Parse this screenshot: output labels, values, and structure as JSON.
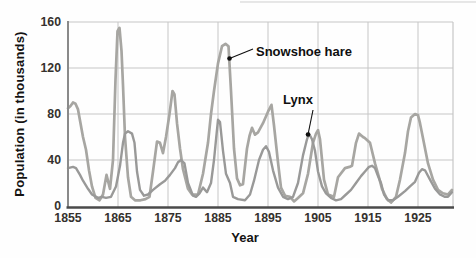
{
  "figure": {
    "x_axis_title": "Year",
    "y_axis_title": "Population (in thousands)"
  },
  "chart_data": {
    "type": "line",
    "title": "",
    "xlabel": "Year",
    "ylabel": "Population (in thousands)",
    "xlim": [
      1855,
      1932
    ],
    "ylim": [
      0,
      160
    ],
    "grid": true,
    "x_ticks": [
      1855,
      1865,
      1875,
      1885,
      1895,
      1905,
      1915,
      1925
    ],
    "y_ticks": [
      0,
      40,
      80,
      120,
      160
    ],
    "legend_position": "none (direct line labels with arrows)",
    "series": [
      {
        "name": "Snowshoe hare",
        "color": "#a7a6a2",
        "width": 2.7,
        "points": [
          [
            1855,
            85
          ],
          [
            1855.5,
            87
          ],
          [
            1856,
            90
          ],
          [
            1856.5,
            89
          ],
          [
            1857,
            84
          ],
          [
            1857.5,
            72
          ],
          [
            1858,
            60
          ],
          [
            1858.6,
            49
          ],
          [
            1859.2,
            31
          ],
          [
            1859.8,
            17
          ],
          [
            1860.5,
            7
          ],
          [
            1861.3,
            5
          ],
          [
            1862,
            10
          ],
          [
            1862.7,
            27
          ],
          [
            1863.4,
            15
          ],
          [
            1864,
            40
          ],
          [
            1864.5,
            110
          ],
          [
            1864.9,
            152
          ],
          [
            1865.3,
            155
          ],
          [
            1865.7,
            135
          ],
          [
            1866,
            105
          ],
          [
            1866.4,
            60
          ],
          [
            1867,
            25
          ],
          [
            1867.6,
            8
          ],
          [
            1868.4,
            5
          ],
          [
            1869.5,
            5
          ],
          [
            1870.5,
            6
          ],
          [
            1871.3,
            8
          ],
          [
            1872,
            30
          ],
          [
            1872.8,
            56
          ],
          [
            1873.4,
            55
          ],
          [
            1874,
            46
          ],
          [
            1874.6,
            60
          ],
          [
            1875.3,
            80
          ],
          [
            1875.9,
            100
          ],
          [
            1876.3,
            97
          ],
          [
            1876.8,
            72
          ],
          [
            1877.4,
            50
          ],
          [
            1878,
            32
          ],
          [
            1879,
            15
          ],
          [
            1879.8,
            10
          ],
          [
            1881,
            10
          ],
          [
            1882,
            28
          ],
          [
            1883,
            55
          ],
          [
            1883.6,
            80
          ],
          [
            1884.2,
            100
          ],
          [
            1885,
            124
          ],
          [
            1885.8,
            139
          ],
          [
            1886.5,
            141
          ],
          [
            1887.1,
            139
          ],
          [
            1887.6,
            100
          ],
          [
            1888.2,
            50
          ],
          [
            1888.8,
            24
          ],
          [
            1889.4,
            18
          ],
          [
            1890,
            19
          ],
          [
            1890.8,
            50
          ],
          [
            1891.3,
            61
          ],
          [
            1891.8,
            68
          ],
          [
            1892.4,
            62
          ],
          [
            1893,
            64
          ],
          [
            1894,
            72
          ],
          [
            1895,
            82
          ],
          [
            1895.7,
            88
          ],
          [
            1896.2,
            70
          ],
          [
            1897,
            38
          ],
          [
            1897.6,
            16
          ],
          [
            1898.4,
            9
          ],
          [
            1899.4,
            8
          ],
          [
            1900.2,
            4
          ],
          [
            1901,
            7
          ],
          [
            1902,
            11
          ],
          [
            1903,
            28
          ],
          [
            1904,
            55
          ],
          [
            1904.6,
            63
          ],
          [
            1905,
            66
          ],
          [
            1905.4,
            58
          ],
          [
            1906.2,
            23
          ],
          [
            1907,
            10
          ],
          [
            1908.2,
            8
          ],
          [
            1909,
            25
          ],
          [
            1910.4,
            33
          ],
          [
            1911.3,
            34
          ],
          [
            1911.8,
            35
          ],
          [
            1912.6,
            55
          ],
          [
            1913.2,
            63
          ],
          [
            1914,
            60
          ],
          [
            1914.4,
            59
          ],
          [
            1915.4,
            55
          ],
          [
            1916.4,
            37
          ],
          [
            1917.2,
            25
          ],
          [
            1917.8,
            15
          ],
          [
            1918.8,
            6
          ],
          [
            1919.6,
            3
          ],
          [
            1920.6,
            8
          ],
          [
            1921.4,
            23
          ],
          [
            1922.4,
            46
          ],
          [
            1923,
            65
          ],
          [
            1923.6,
            77
          ],
          [
            1924.4,
            80
          ],
          [
            1925,
            79
          ],
          [
            1925.4,
            72
          ],
          [
            1926,
            59
          ],
          [
            1927,
            37
          ],
          [
            1928,
            23
          ],
          [
            1929,
            14
          ],
          [
            1930,
            11
          ],
          [
            1931,
            10
          ],
          [
            1931.8,
            14
          ]
        ]
      },
      {
        "name": "Lynx",
        "color": "#999998",
        "width": 2.4,
        "points": [
          [
            1855,
            33
          ],
          [
            1856,
            34
          ],
          [
            1856.6,
            33
          ],
          [
            1857.4,
            27
          ],
          [
            1858,
            22
          ],
          [
            1859,
            15
          ],
          [
            1859.8,
            10
          ],
          [
            1861,
            7
          ],
          [
            1861.8,
            8
          ],
          [
            1862.6,
            7
          ],
          [
            1863.6,
            8
          ],
          [
            1864.6,
            17
          ],
          [
            1865.4,
            35
          ],
          [
            1866,
            55
          ],
          [
            1866.4,
            63
          ],
          [
            1867,
            65
          ],
          [
            1867.8,
            63
          ],
          [
            1868.3,
            55
          ],
          [
            1868.8,
            30
          ],
          [
            1869.4,
            14
          ],
          [
            1870.2,
            9
          ],
          [
            1871,
            10
          ],
          [
            1872,
            14
          ],
          [
            1873.4,
            19
          ],
          [
            1874.4,
            22
          ],
          [
            1875.4,
            27
          ],
          [
            1876.4,
            33
          ],
          [
            1877,
            38
          ],
          [
            1877.6,
            40
          ],
          [
            1878.3,
            37
          ],
          [
            1879,
            20
          ],
          [
            1880,
            9
          ],
          [
            1880.6,
            8
          ],
          [
            1881.3,
            11
          ],
          [
            1882,
            16
          ],
          [
            1882.8,
            12
          ],
          [
            1883.6,
            20
          ],
          [
            1884.2,
            40
          ],
          [
            1884.7,
            62
          ],
          [
            1885,
            75
          ],
          [
            1885.4,
            73
          ],
          [
            1886,
            48
          ],
          [
            1886.6,
            28
          ],
          [
            1887.4,
            20
          ],
          [
            1888,
            8
          ],
          [
            1889,
            6
          ],
          [
            1890.4,
            5
          ],
          [
            1891.4,
            10
          ],
          [
            1892.2,
            22
          ],
          [
            1893.2,
            40
          ],
          [
            1894,
            49
          ],
          [
            1894.6,
            52
          ],
          [
            1895.2,
            47
          ],
          [
            1896,
            31
          ],
          [
            1897,
            16
          ],
          [
            1898,
            8
          ],
          [
            1899,
            6
          ],
          [
            1900,
            8
          ],
          [
            1901,
            20
          ],
          [
            1902,
            44
          ],
          [
            1902.8,
            58
          ],
          [
            1903.2,
            63
          ],
          [
            1903.8,
            58
          ],
          [
            1904.4,
            48
          ],
          [
            1905,
            30
          ],
          [
            1905.8,
            17
          ],
          [
            1906.6,
            11
          ],
          [
            1907.6,
            7
          ],
          [
            1908.6,
            5
          ],
          [
            1909.6,
            6
          ],
          [
            1910.6,
            10
          ],
          [
            1911.6,
            14
          ],
          [
            1912.6,
            20
          ],
          [
            1913.6,
            26
          ],
          [
            1914.4,
            30
          ],
          [
            1915.2,
            34
          ],
          [
            1915.8,
            35
          ],
          [
            1916.4,
            33
          ],
          [
            1917,
            26
          ],
          [
            1917.6,
            20
          ],
          [
            1918.2,
            10
          ],
          [
            1919,
            5
          ],
          [
            1920,
            5
          ],
          [
            1921,
            8
          ],
          [
            1922.4,
            13
          ],
          [
            1923.4,
            17
          ],
          [
            1924.4,
            21
          ],
          [
            1925.2,
            29
          ],
          [
            1925.8,
            32
          ],
          [
            1926.4,
            31
          ],
          [
            1927.4,
            23
          ],
          [
            1928.4,
            15
          ],
          [
            1929.4,
            10
          ],
          [
            1930.4,
            8
          ],
          [
            1931,
            8
          ],
          [
            1931.8,
            12
          ]
        ]
      }
    ],
    "annotations": [
      {
        "text": "Snowshoe hare",
        "target": {
          "year": 1887.3,
          "value": 128
        },
        "line_from_px": [
          253,
          49
        ],
        "dot_px": [
          229.5,
          58.5
        ]
      },
      {
        "text": "Lynx",
        "target": {
          "year": 1903,
          "value": 62
        },
        "line_from_px": [
          313,
          110
        ],
        "dot_px": [
          308,
          134.5
        ]
      }
    ]
  },
  "style": {
    "grid_color": "#c6c6c6",
    "left_axis_color": "#8a8a8a",
    "bottom_axis_color": "#4a4a4a",
    "tick_text_color": "#35312d",
    "annotation_color": "#0f0f0f",
    "page_edge_line_color": "#cfcfcf"
  }
}
